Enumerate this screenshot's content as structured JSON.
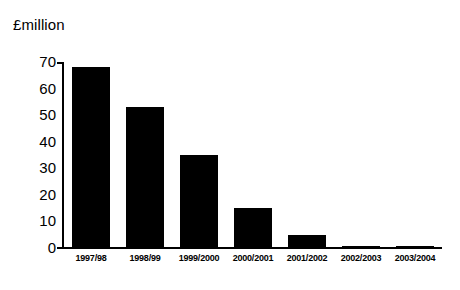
{
  "chart_data": {
    "type": "bar",
    "title": "",
    "subtitle": "",
    "unit_label": "£million",
    "xlabel": "",
    "ylabel": "£million",
    "categories": [
      "1997/98",
      "1998/99",
      "1999/2000",
      "2000/2001",
      "2001/2002",
      "2002/2003",
      "2003/2004"
    ],
    "values": [
      68,
      53,
      35,
      15,
      5,
      0.5,
      0.3
    ],
    "series": [
      {
        "name": "£million",
        "values": [
          68,
          53,
          35,
          15,
          5,
          0.5,
          0.3
        ]
      }
    ],
    "ylim": [
      0,
      70
    ],
    "ytick_labels": [
      "70",
      "60",
      "50",
      "40",
      "30",
      "20",
      "10",
      "0"
    ],
    "ytick_values": [
      70,
      60,
      50,
      40,
      30,
      20,
      10,
      0
    ],
    "grid": false,
    "legend": false,
    "legend_position": "none",
    "bar_color": "#000000",
    "background_color": "#FFFFFF",
    "axis_color": "#000000"
  }
}
